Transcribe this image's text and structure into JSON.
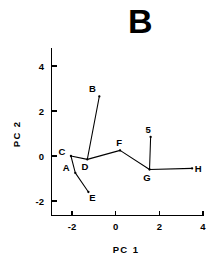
{
  "panel": {
    "label": "B"
  },
  "axes": {
    "xlabel": "PC  1",
    "ylabel": "PC  2",
    "xticks": [
      "-2",
      "0",
      "2",
      "4"
    ],
    "yticks": [
      "-2",
      "0",
      "2",
      "4"
    ]
  },
  "chart_data": {
    "type": "scatter",
    "title": "B",
    "xlabel": "PC  1",
    "ylabel": "PC  2",
    "xlim": [
      -2.9,
      4.0
    ],
    "ylim": [
      -2.55,
      4.6
    ],
    "xticks": [
      -2,
      0,
      2,
      4
    ],
    "yticks": [
      -2,
      0,
      2,
      4
    ],
    "grid": false,
    "legend": false,
    "points": [
      {
        "label": "A",
        "x": -1.85,
        "y": -0.75
      },
      {
        "label": "B",
        "x": -0.75,
        "y": 2.65
      },
      {
        "label": "C",
        "x": -2.05,
        "y": 0.0
      },
      {
        "label": "D",
        "x": -1.3,
        "y": -0.15
      },
      {
        "label": "E",
        "x": -1.25,
        "y": -1.6
      },
      {
        "label": "F",
        "x": 0.2,
        "y": 0.25
      },
      {
        "label": "G",
        "x": 1.55,
        "y": -0.6
      },
      {
        "label": "5",
        "x": 1.6,
        "y": 0.85
      },
      {
        "label": "H",
        "x": 3.5,
        "y": -0.55
      }
    ],
    "paths": [
      [
        "E",
        "A",
        "C",
        "D",
        "F",
        "G",
        "H"
      ],
      [
        "D",
        "B"
      ],
      [
        "G",
        "5"
      ]
    ]
  }
}
